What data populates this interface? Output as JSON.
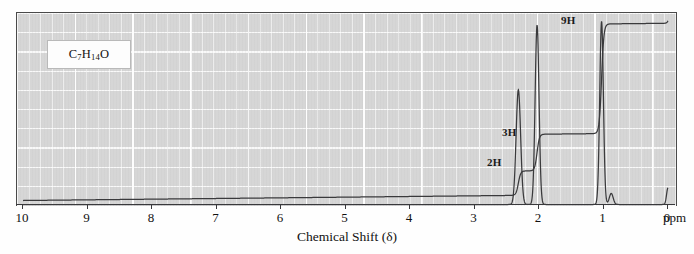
{
  "figure": {
    "kind": "nmr-spectrum",
    "formula": {
      "prefix": "C",
      "sub1": "7",
      "mid": "H",
      "sub2": "14",
      "suffix": "O",
      "plain": "C7H14O"
    },
    "xaxis_title": "Chemical Shift (δ)",
    "unit_label": "ppm",
    "background_color": "#d6d6d6",
    "grid_color": "#ffffff",
    "trace_color": "#3a3a3c"
  },
  "chart_data": {
    "type": "line",
    "title": "",
    "xlabel": "Chemical Shift (δ)",
    "ylabel": "",
    "xlim": [
      10,
      0
    ],
    "ylim": [
      0,
      100
    ],
    "grid": true,
    "legend": null,
    "tick_labels": [
      "10",
      "9",
      "8",
      "7",
      "6",
      "5",
      "4",
      "3",
      "2",
      "1",
      "0"
    ],
    "tick_values": [
      10,
      9,
      8,
      7,
      6,
      5,
      4,
      3,
      2,
      1,
      0
    ],
    "series": [
      {
        "name": "spectrum",
        "peaks": [
          {
            "shift_ppm": 2.32,
            "height_pct": 62,
            "label": "2H",
            "protons": 2,
            "width_ppm": 0.035
          },
          {
            "shift_ppm": 2.03,
            "height_pct": 97,
            "label": "3H",
            "protons": 3,
            "width_ppm": 0.03
          },
          {
            "shift_ppm": 1.03,
            "height_pct": 99,
            "label": "9H",
            "protons": 9,
            "width_ppm": 0.028
          },
          {
            "shift_ppm": 0.88,
            "height_pct": 6,
            "label": "",
            "protons": 0,
            "width_ppm": 0.03
          },
          {
            "shift_ppm": 0.0,
            "height_pct": 9,
            "label": "TMS",
            "protons": 0,
            "width_ppm": 0.022
          }
        ]
      },
      {
        "name": "integration",
        "steps": [
          {
            "shift_ppm": 2.32,
            "rise_units": 2
          },
          {
            "shift_ppm": 2.03,
            "rise_units": 3
          },
          {
            "shift_ppm": 1.03,
            "rise_units": 9
          },
          {
            "shift_ppm": 0.0,
            "rise_units": 0.4
          }
        ],
        "total_units": 14
      }
    ],
    "annotations": [
      {
        "text": "2H",
        "shift_ppm": 2.45,
        "y_pct": 27
      },
      {
        "text": "3H",
        "shift_ppm": 2.18,
        "y_pct": 43
      },
      {
        "text": "9H",
        "shift_ppm": 1.18,
        "y_pct": 95
      },
      {
        "text": "C7H14O",
        "shift_ppm": 8.8,
        "y_pct": 88
      }
    ]
  },
  "labels": {
    "h2": "2H",
    "h3": "3H",
    "h9": "9H"
  }
}
